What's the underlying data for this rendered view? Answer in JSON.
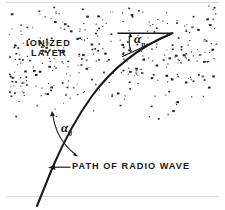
{
  "figure": {
    "type": "physics-diagram",
    "background_color": "#ffffff",
    "ink_color": "#1a1a1a",
    "labels": {
      "region_label_line1": "IONIZED",
      "region_label_line2": "LAYER",
      "angle_incident": "α",
      "angle_incident_sub": "0",
      "angle_upper": "α",
      "angle_upper_sub": "n",
      "path_caption": "PATH OF RADIO WAVE"
    },
    "elements": {
      "stipple_region": {
        "name": "ionized-layer-stipple",
        "x": 8,
        "y": 4,
        "width": 208,
        "height": 116,
        "dot_count": 520
      },
      "ray_path": {
        "name": "radio-wave-path",
        "start": [
          37,
          206
        ],
        "end": [
          172,
          33
        ],
        "description": "curved refracting ray, concave upward-right"
      },
      "reference_line": {
        "name": "horizontal-reference-line",
        "start": [
          118,
          33
        ],
        "end": [
          173,
          33
        ]
      },
      "angle_arc_upper": {
        "name": "angle-arc-upper",
        "vertex": [
          172,
          33
        ],
        "from_deg": 180,
        "to_deg": 205
      },
      "angle_arc_lower": {
        "name": "angle-arc-lower",
        "from": [
          52,
          112
        ],
        "to": [
          78,
          156
        ]
      },
      "caption_arrow": {
        "name": "caption-arrow",
        "from": [
          70,
          167
        ],
        "to": [
          50,
          170
        ]
      }
    }
  }
}
